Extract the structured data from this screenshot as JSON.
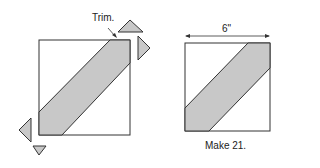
{
  "labels": {
    "trim": "Trim.",
    "dimension": "6\"",
    "make": "Make 21."
  },
  "colors": {
    "fill": "#c8c8c8",
    "stroke": "#333333"
  }
}
